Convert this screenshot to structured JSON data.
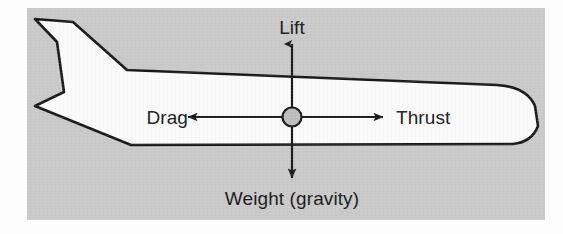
{
  "figure": {
    "panel": {
      "background_color": "#c9c9c9",
      "outer_background_color": "#fdfdfd",
      "x": 27,
      "y": 8,
      "width": 518,
      "height": 212
    },
    "aircraft": {
      "name": "airliner-side-silhouette",
      "fill_color": "#fafafa",
      "outline_color": "#1a1a1a",
      "outline_width": 2.6,
      "facing": "right"
    },
    "center_of_gravity": {
      "name": "center-of-gravity-marker",
      "cx": 265,
      "cy": 109,
      "r": 9.5,
      "fill_color": "#bdbdbd",
      "stroke_color": "#1a1a1a"
    },
    "forces": [
      {
        "id": "lift",
        "label": "Lift",
        "direction": "up",
        "label_x": 265,
        "label_y": 26,
        "tip_x": 265,
        "tip_y": 34,
        "tail_x": 265,
        "tail_y": 100
      },
      {
        "id": "thrust",
        "label": "Thrust",
        "direction": "right",
        "label_x": 369,
        "label_y": 116,
        "tip_x": 357,
        "tip_y": 109,
        "tail_x": 275,
        "tail_y": 109
      },
      {
        "id": "weight",
        "label": "Weight (gravity)",
        "direction": "down",
        "label_x": 265,
        "label_y": 197,
        "tip_x": 265,
        "tip_y": 172,
        "tail_x": 265,
        "tail_y": 119
      },
      {
        "id": "drag",
        "label": "Drag",
        "direction": "left",
        "label_x": 161,
        "label_y": 116,
        "tip_x": 160,
        "tip_y": 109,
        "tail_x": 256,
        "tail_y": 109
      }
    ],
    "arrow_color": "#1a1a1a",
    "arrow_width": 2.2,
    "label_color": "#1a1a1a",
    "label_font_size": 19
  }
}
